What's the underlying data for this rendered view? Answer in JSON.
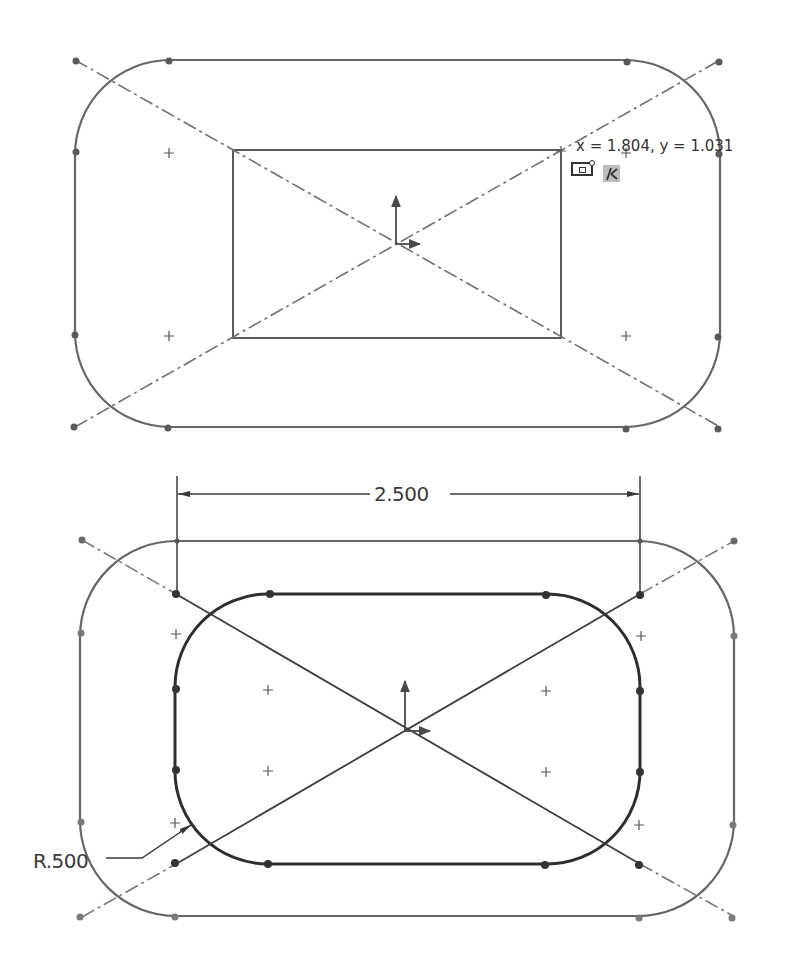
{
  "colors": {
    "sketch_line": "#666666",
    "dark_line": "#2e2e2e",
    "construction": "#707070",
    "background": "#ffffff",
    "relation_bg": "#bdbdbd"
  },
  "top_sketch": {
    "outer_rounded_rect": {
      "x": 75,
      "y": 60,
      "w": 645,
      "h": 367,
      "r": 95
    },
    "inner_rect": {
      "x": 233,
      "y": 150,
      "w": 328,
      "h": 188
    },
    "centerlines": [
      {
        "x1": 75,
        "y1": 60,
        "x2": 720,
        "y2": 427
      },
      {
        "x1": 75,
        "y1": 427,
        "x2": 720,
        "y2": 60
      }
    ],
    "center_marks": [
      [
        169,
        153
      ],
      [
        626,
        153
      ],
      [
        169,
        333
      ],
      [
        626,
        333
      ]
    ],
    "origin": {
      "x": 396,
      "y": 243
    },
    "cursor_readout": "x = 1.804, y = 1.031",
    "cursor_icons": [
      "rectangle-sketch-icon",
      "coincident-relation-icon"
    ]
  },
  "bottom_sketch": {
    "outer_rounded_rect": {
      "x": 79,
      "y": 540,
      "w": 656,
      "h": 375,
      "r": 96
    },
    "inner_rounded_rect": {
      "x": 175,
      "y": 594,
      "w": 465,
      "h": 270,
      "r": 93
    },
    "centerlines": [
      {
        "x1": 82,
        "y1": 540,
        "x2": 735,
        "y2": 917
      },
      {
        "x1": 82,
        "y1": 917,
        "x2": 735,
        "y2": 540
      }
    ],
    "center_marks": [
      [
        176,
        634
      ],
      [
        641,
        634
      ],
      [
        268,
        690
      ],
      [
        546,
        690
      ],
      [
        268,
        771
      ],
      [
        546,
        771
      ],
      [
        176,
        824
      ],
      [
        639,
        824
      ]
    ],
    "origin": {
      "x": 405,
      "y": 730
    },
    "dimensions": {
      "width_label": "2.500",
      "radius_label": "R.500"
    }
  }
}
